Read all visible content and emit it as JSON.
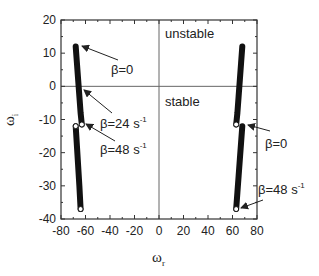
{
  "chart_data": {
    "type": "line",
    "title": "",
    "xlabel": "ω_r",
    "ylabel": "ω_i",
    "xlabel_main": "ω",
    "xlabel_sub": "r",
    "ylabel_main": "ω",
    "ylabel_sub": "i",
    "xlim": [
      -80,
      80
    ],
    "ylim": [
      -40,
      20
    ],
    "xticks": [
      -80,
      -60,
      -40,
      -20,
      0,
      20,
      40,
      60,
      80
    ],
    "xtick_labels": [
      "-80",
      "-60",
      "-40",
      "-20",
      "0",
      "20",
      "40",
      "60",
      "80"
    ],
    "yticks": [
      20,
      10,
      0,
      -10,
      -20,
      -30,
      -40
    ],
    "ytick_labels": [
      "20",
      "10",
      "0",
      "-10",
      "-20",
      "-30",
      "-40"
    ],
    "grid": false,
    "reference_lines": [
      {
        "orientation": "horizontal",
        "value": 0
      },
      {
        "orientation": "vertical",
        "value": 0
      }
    ],
    "regions": [
      {
        "label": "unstable",
        "x": 0,
        "y": 16
      },
      {
        "label": "stable",
        "x": 0,
        "y": -5
      }
    ],
    "series": [
      {
        "name": "left-upper-branch",
        "x": [
          -68,
          -67,
          -66,
          -65,
          -64,
          -63
        ],
        "y": [
          12,
          7,
          2,
          -3,
          -8,
          -11.5
        ],
        "end_marker": "open-circle"
      },
      {
        "name": "left-lower-branch",
        "x": [
          -68,
          -67,
          -66,
          -65,
          -64
        ],
        "y": [
          -12,
          -18,
          -24,
          -30,
          -37
        ],
        "start_marker": "open-circle",
        "end_marker": "open-circle"
      },
      {
        "name": "right-upper-branch",
        "x": [
          68,
          67,
          66,
          65,
          64,
          63
        ],
        "y": [
          12,
          7,
          2,
          -3,
          -8,
          -11.5
        ],
        "end_marker": "open-circle"
      },
      {
        "name": "right-lower-branch",
        "x": [
          68,
          67,
          66,
          65,
          64,
          63
        ],
        "y": [
          -12,
          -17,
          -22,
          -27,
          -32,
          -37
        ],
        "end_marker": "open-circle"
      }
    ],
    "annotations": [
      {
        "text": "β=0",
        "main": "β=0",
        "sup": "",
        "points_to": [
          -68,
          12
        ]
      },
      {
        "text": "β=24 s^-1",
        "main": "β=24 s",
        "sup": "-1",
        "points_to": [
          -66,
          -1
        ]
      },
      {
        "text": "β=48 s^-1",
        "main": "β=48 s",
        "sup": "-1",
        "points_to": [
          -63,
          -11.5
        ]
      },
      {
        "text": "β=0",
        "main": "β=0",
        "sup": "",
        "points_to": [
          68,
          -12
        ]
      },
      {
        "text": "β=48 s^-1",
        "main": "β=48 s",
        "sup": "-1",
        "points_to": [
          63,
          -37
        ]
      }
    ]
  },
  "colors": {
    "curve": "#111111",
    "axis": "#333333",
    "reference_line": "#666666",
    "text": "#222222"
  }
}
